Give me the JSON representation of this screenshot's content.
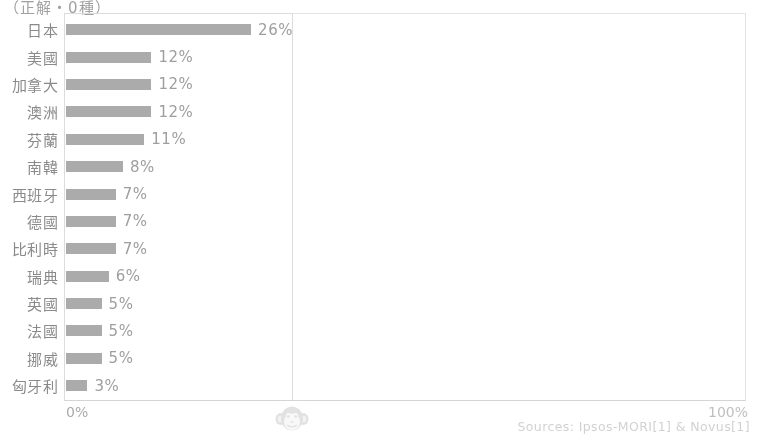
{
  "caption": "（正解・0種）",
  "axis": {
    "left_tick": "0%",
    "right_tick": "100%"
  },
  "source_credit": "Sources: Ipsos-MORI[1] & Novus[1]",
  "watermark": {
    "icon": "monkey-face-icon"
  },
  "colors": {
    "bar": "#9c9c9c",
    "label_text": "#6f6f6f",
    "value_text": "#8a8a8a",
    "plot_border": "#dedede",
    "axis_line": "#d5d5d5",
    "source_text": "#d0d0d0"
  },
  "chart_data": {
    "type": "bar",
    "orientation": "horizontal",
    "title": "",
    "subtitle": "",
    "xlabel": "",
    "ylabel": "",
    "xlim": [
      0,
      100
    ],
    "grid": false,
    "legend": "none",
    "value_suffix": "%",
    "categories": [
      "日本",
      "美國",
      "加拿大",
      "澳洲",
      "芬蘭",
      "南韓",
      "西班牙",
      "德國",
      "比利時",
      "瑞典",
      "英國",
      "法國",
      "挪威",
      "匈牙利"
    ],
    "values": [
      26,
      12,
      12,
      12,
      11,
      8,
      7,
      7,
      7,
      6,
      5,
      5,
      5,
      3
    ],
    "labels": [
      "26%",
      "12%",
      "12%",
      "12%",
      "11%",
      "8%",
      "7%",
      "7%",
      "7%",
      "6%",
      "5%",
      "5%",
      "5%",
      "3%"
    ],
    "bars": [
      {
        "category": "日本",
        "value": 26,
        "label": "26%"
      },
      {
        "category": "美國",
        "value": 12,
        "label": "12%"
      },
      {
        "category": "加拿大",
        "value": 12,
        "label": "12%"
      },
      {
        "category": "澳洲",
        "value": 12,
        "label": "12%"
      },
      {
        "category": "芬蘭",
        "value": 11,
        "label": "11%"
      },
      {
        "category": "南韓",
        "value": 8,
        "label": "8%"
      },
      {
        "category": "西班牙",
        "value": 7,
        "label": "7%"
      },
      {
        "category": "德國",
        "value": 7,
        "label": "7%"
      },
      {
        "category": "比利時",
        "value": 7,
        "label": "7%"
      },
      {
        "category": "瑞典",
        "value": 6,
        "label": "6%"
      },
      {
        "category": "英國",
        "value": 5,
        "label": "5%"
      },
      {
        "category": "法國",
        "value": 5,
        "label": "5%"
      },
      {
        "category": "挪威",
        "value": 5,
        "label": "5%"
      },
      {
        "category": "匈牙利",
        "value": 3,
        "label": "3%"
      }
    ]
  }
}
